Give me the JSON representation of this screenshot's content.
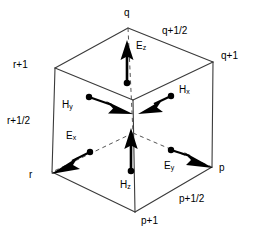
{
  "figure": {
    "background_color": "#ffffff",
    "line_color": "#3a3a3a",
    "arrow_color": "#000000",
    "dot_color": "#000000"
  },
  "axis_labels": {
    "top": [
      {
        "name": "q",
        "text": "q",
        "x": 124,
        "y": 10
      },
      {
        "name": "q-half",
        "text": "q+1/2",
        "x": 162,
        "y": 27
      },
      {
        "name": "q-plus-1",
        "text": "q+1",
        "x": 222,
        "y": 52
      }
    ],
    "left": [
      {
        "name": "r-plus-1",
        "text": "r+1",
        "x": 14,
        "y": 60
      },
      {
        "name": "r-half",
        "text": "r+1/2",
        "x": 8,
        "y": 116
      },
      {
        "name": "r",
        "text": "r",
        "x": 30,
        "y": 170
      }
    ],
    "bottom_right": [
      {
        "name": "p",
        "text": "p",
        "x": 219,
        "y": 164
      },
      {
        "name": "p-half",
        "text": "p+1/2",
        "x": 180,
        "y": 194
      },
      {
        "name": "p-plus-1",
        "text": "p+1",
        "x": 142,
        "y": 216
      }
    ]
  },
  "field_vectors": [
    {
      "name": "Ez",
      "base": "E",
      "sub": "z",
      "label_x": 136,
      "label_y": 42,
      "dot_x": 127,
      "dot_y": 83,
      "tip_x": 127,
      "tip_y": 42,
      "direction": "up",
      "kind": "E"
    },
    {
      "name": "Hy",
      "base": "H",
      "sub": "y",
      "label_x": 62,
      "label_y": 100,
      "dot_x": 89,
      "dot_y": 97,
      "tip_x": 132,
      "tip_y": 113,
      "direction": "right-down",
      "kind": "H"
    },
    {
      "name": "Hx",
      "base": "H",
      "sub": "x",
      "label_x": 179,
      "label_y": 86,
      "dot_x": 171,
      "dot_y": 96,
      "tip_x": 139,
      "tip_y": 114,
      "direction": "left-down",
      "kind": "H"
    },
    {
      "name": "Ex",
      "base": "E",
      "sub": "x",
      "label_x": 66,
      "label_y": 132,
      "dot_x": 90,
      "dot_y": 152,
      "tip_x": 52,
      "tip_y": 173,
      "direction": "left-down",
      "kind": "E"
    },
    {
      "name": "Ey",
      "base": "E",
      "sub": "y",
      "label_x": 164,
      "label_y": 161,
      "dot_x": 171,
      "dot_y": 150,
      "tip_x": 212,
      "tip_y": 168,
      "direction": "right-down",
      "kind": "E"
    },
    {
      "name": "Hz",
      "base": "H",
      "sub": "z",
      "label_x": 120,
      "label_y": 180,
      "dot_x": 131,
      "dot_y": 171,
      "tip_x": 131,
      "tip_y": 129,
      "direction": "up",
      "kind": "H"
    }
  ],
  "cube": {
    "vertices": {
      "back_top": {
        "x": 128,
        "y": 28
      },
      "left_top": {
        "x": 55,
        "y": 68
      },
      "right_top": {
        "x": 213,
        "y": 62
      },
      "front_top": {
        "x": 133,
        "y": 100
      },
      "left_bottom": {
        "x": 52,
        "y": 172
      },
      "right_bottom": {
        "x": 212,
        "y": 167
      },
      "front_bottom": {
        "x": 135,
        "y": 212
      },
      "hidden_back_bottom": {
        "x": 133,
        "y": 133
      }
    },
    "solid_edges": [
      "back_top-left_top",
      "back_top-right_top",
      "left_top-left_bottom",
      "right_top-right_bottom",
      "left_top-front_top",
      "right_top-front_top",
      "front_top-front_bottom",
      "left_bottom-front_bottom",
      "right_bottom-front_bottom"
    ],
    "dashed_edges": [
      "back_top-hidden_back_bottom",
      "hidden_back_bottom-left_bottom",
      "hidden_back_bottom-right_bottom"
    ]
  }
}
